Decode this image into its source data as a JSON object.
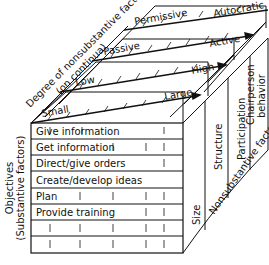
{
  "diagram": {
    "axis_labels": {
      "depth_axis": "Degree of nonsubstantive factors",
      "depth_axis_sub": "(on continua)",
      "vertical_axis": "Objectives",
      "vertical_axis_sub": "(Substantive factors)",
      "right_axis": "Nonsubstantive factors"
    },
    "layers": [
      {
        "name": "Size",
        "low": "Small",
        "high": "Large"
      },
      {
        "name": "Structure",
        "low": "Low",
        "high": "High"
      },
      {
        "name": "Participation",
        "low": "Passive",
        "high": "Active"
      },
      {
        "name": "Chairperson behavior",
        "name_line1": "Chairperson",
        "name_line2": "behavior",
        "low": "Permissive",
        "high": "Autocratic"
      }
    ],
    "objectives": [
      "Give information",
      "Get information",
      "Direct/give orders",
      "Create/develop ideas",
      "Plan",
      "Provide training",
      "",
      ""
    ]
  }
}
